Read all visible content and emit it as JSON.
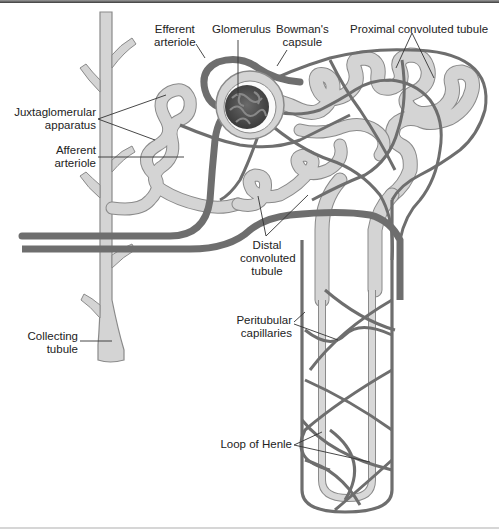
{
  "diagram": {
    "colors": {
      "tubule_fill": "#d4d4d4",
      "tubule_stroke": "#8a8a8a",
      "vessel": "#6e6e6e",
      "glomerulus": "#555555",
      "leader_line": "#333333",
      "text": "#222222"
    },
    "labels": {
      "efferent_arteriole": {
        "line1": "Efferent",
        "line2": "arteriole"
      },
      "glomerulus": {
        "line1": "Glomerulus"
      },
      "bowmans_capsule": {
        "line1": "Bowman's",
        "line2": "capsule"
      },
      "proximal_convoluted_tubule": {
        "line1": "Proximal convoluted tubule"
      },
      "juxtaglomerular_apparatus": {
        "line1": "Juxtaglomerular",
        "line2": "apparatus"
      },
      "afferent_arteriole": {
        "line1": "Afferent",
        "line2": "arteriole"
      },
      "distal_convoluted_tubule": {
        "line1": "Distal",
        "line2": "convoluted",
        "line3": "tubule"
      },
      "collecting_tubule": {
        "line1": "Collecting",
        "line2": "tubule"
      },
      "peritubular_capillaries": {
        "line1": "Peritubular",
        "line2": "capillaries"
      },
      "loop_of_henle": {
        "line1": "Loop of Henle"
      }
    }
  }
}
